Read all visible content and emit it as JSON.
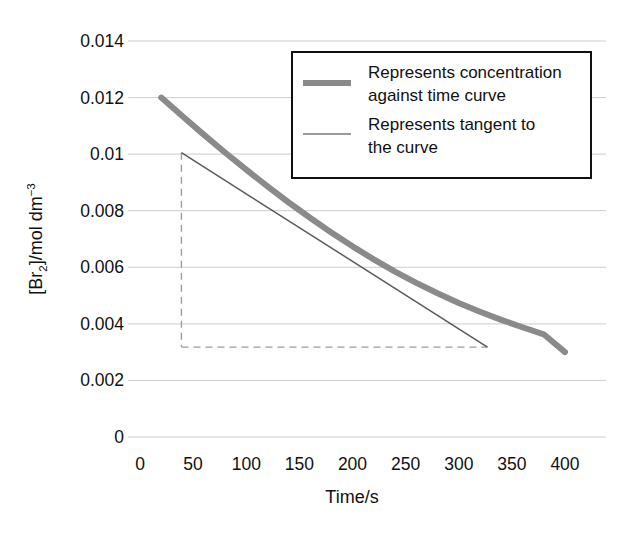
{
  "chart_data": {
    "type": "line",
    "title": "",
    "xlabel": "Time/s",
    "ylabel": "[Br2]/mol dm-3",
    "ylabel_parts": {
      "prefix": "[Br",
      "sub": "2",
      "middle": "]/mol dm",
      "sup": "−3"
    },
    "xlim": [
      0,
      410
    ],
    "ylim": [
      0,
      0.0145
    ],
    "xticks": [
      0,
      50,
      100,
      150,
      200,
      250,
      300,
      350,
      400
    ],
    "xtick_labels": [
      "0",
      "50",
      "100",
      "150",
      "200",
      "250",
      "300",
      "350",
      "400"
    ],
    "yticks": [
      0,
      0.002,
      0.004,
      0.006,
      0.008,
      0.01,
      0.012,
      0.014
    ],
    "ytick_labels": [
      "0",
      "0.002",
      "0.004",
      "0.006",
      "0.008",
      "0.01",
      "0.012",
      "0.014"
    ],
    "grid": "horizontal",
    "legend_position": "top-right",
    "series": [
      {
        "name": "concentration-time curve",
        "legend_label_line1": "Represents concentration",
        "legend_label_line2": "against time curve",
        "color": "#8a8a8a",
        "width": 6,
        "style": "solid",
        "x": [
          20,
          40,
          60,
          80,
          100,
          120,
          140,
          160,
          180,
          200,
          220,
          240,
          260,
          280,
          300,
          320,
          340,
          360,
          380,
          400
        ],
        "y": [
          0.012,
          0.01134,
          0.01069,
          0.01006,
          0.00945,
          0.00886,
          0.00829,
          0.00775,
          0.00723,
          0.00674,
          0.00628,
          0.00585,
          0.00545,
          0.00508,
          0.00474,
          0.00443,
          0.00414,
          0.00388,
          0.00363,
          0.003
        ]
      },
      {
        "name": "tangent to the curve",
        "legend_label_line1": "Represents tangent to",
        "legend_label_line2": "the curve",
        "color": "#5a5a5a",
        "width": 1.4,
        "style": "solid",
        "x": [
          39,
          327
        ],
        "y": [
          0.01005,
          0.00318
        ]
      }
    ],
    "construction_lines": [
      {
        "name": "tangent-vertical-dashed",
        "style": "dashed",
        "color": "#9a9a9a",
        "x": [
          39,
          39
        ],
        "y": [
          0.01005,
          0.00318
        ]
      },
      {
        "name": "tangent-horizontal-dashed",
        "style": "dashed",
        "color": "#9a9a9a",
        "x": [
          39,
          327
        ],
        "y": [
          0.00318,
          0.00318
        ]
      }
    ],
    "annotations": []
  },
  "legend": {
    "entries": [
      {
        "swatch": "thick-gray-line",
        "line1": "Represents concentration",
        "line2": "against time curve"
      },
      {
        "swatch": "thin-gray-line",
        "line1": "Represents tangent to",
        "line2": "the curve"
      }
    ]
  },
  "axes": {
    "x_title": "Time/s",
    "y_title_prefix": "[Br",
    "y_title_sub": "2",
    "y_title_middle": "]/mol dm",
    "y_title_sup": "−3"
  }
}
